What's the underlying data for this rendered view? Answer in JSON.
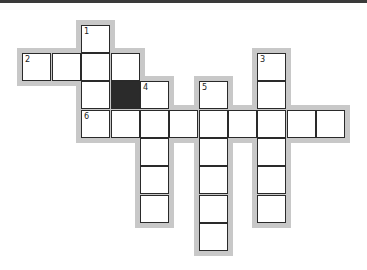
{
  "puzzle": {
    "type": "crossword",
    "cell_size": 29,
    "origin": {
      "x": 22,
      "y": 25
    },
    "colors": {
      "shadow": "#c8c8c8",
      "border": "#2a2a2a",
      "black": "#2b2b2b",
      "empty": "#ffffff"
    },
    "clue_numbers": [
      "1",
      "2",
      "3",
      "4",
      "5",
      "6"
    ],
    "cells": [
      {
        "r": 0,
        "c": 2,
        "num": "1"
      },
      {
        "r": 1,
        "c": 0,
        "num": "2"
      },
      {
        "r": 1,
        "c": 1
      },
      {
        "r": 1,
        "c": 2
      },
      {
        "r": 1,
        "c": 3
      },
      {
        "r": 1,
        "c": 8,
        "num": "3"
      },
      {
        "r": 2,
        "c": 2
      },
      {
        "r": 2,
        "c": 3,
        "black": true
      },
      {
        "r": 2,
        "c": 4,
        "num": "4"
      },
      {
        "r": 2,
        "c": 6,
        "num": "5"
      },
      {
        "r": 2,
        "c": 8
      },
      {
        "r": 3,
        "c": 2,
        "num": "6"
      },
      {
        "r": 3,
        "c": 3
      },
      {
        "r": 3,
        "c": 4
      },
      {
        "r": 3,
        "c": 5
      },
      {
        "r": 3,
        "c": 6
      },
      {
        "r": 3,
        "c": 7
      },
      {
        "r": 3,
        "c": 8
      },
      {
        "r": 3,
        "c": 9
      },
      {
        "r": 3,
        "c": 10
      },
      {
        "r": 4,
        "c": 4
      },
      {
        "r": 4,
        "c": 6
      },
      {
        "r": 4,
        "c": 8
      },
      {
        "r": 5,
        "c": 4
      },
      {
        "r": 5,
        "c": 6
      },
      {
        "r": 5,
        "c": 8
      },
      {
        "r": 6,
        "c": 4
      },
      {
        "r": 6,
        "c": 6
      },
      {
        "r": 6,
        "c": 8
      },
      {
        "r": 7,
        "c": 6
      }
    ]
  }
}
